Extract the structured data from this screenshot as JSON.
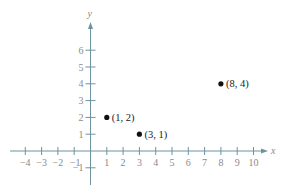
{
  "chart_data": {
    "type": "scatter",
    "title": "",
    "xlabel": "x",
    "ylabel": "y",
    "xlim": [
      -4,
      10
    ],
    "ylim": [
      -1,
      6
    ],
    "x_ticks": [
      -4,
      -3,
      -2,
      -1,
      1,
      2,
      3,
      4,
      5,
      6,
      7,
      8,
      9,
      10
    ],
    "y_ticks": [
      -1,
      1,
      2,
      3,
      4,
      5,
      6
    ],
    "grid": false,
    "series": [
      {
        "name": "points",
        "points": [
          {
            "x": 1,
            "y": 2,
            "label": "(1, 2)"
          },
          {
            "x": 3,
            "y": 1,
            "label": "(3, 1)"
          },
          {
            "x": 8,
            "y": 4,
            "label": "(8, 4)"
          }
        ]
      }
    ]
  },
  "colors": {
    "axis": "#6b93a0",
    "tick_label": "#8a8a8a",
    "point": "#111111"
  },
  "layout": {
    "origin_px": [
      90.5,
      151
    ],
    "unit_x_px": 16.3,
    "unit_y_px": 16.8,
    "x_axis_px": [
      10,
      268
    ],
    "y_axis_px": [
      185,
      22
    ]
  }
}
